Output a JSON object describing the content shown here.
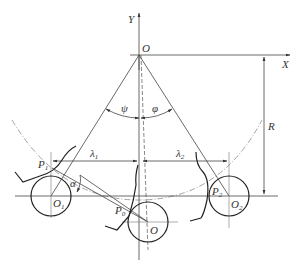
{
  "diagram": {
    "labels": {
      "y_axis": "Y",
      "x_axis": "X",
      "origin": "O",
      "psi": "ψ",
      "phi": "φ",
      "radius": "R",
      "lambda1": "λ",
      "lambda1_sub": "1",
      "lambda2": "λ",
      "lambda2_sub": "2",
      "p1": "P",
      "p1_sub": "1",
      "p2": "P",
      "p2_sub": "2",
      "p0": "P",
      "p0_sub": "0",
      "o1": "O",
      "o1_sub": "1",
      "o2": "O",
      "o2_sub": "2",
      "o_center": "O",
      "alpha": "α"
    }
  }
}
